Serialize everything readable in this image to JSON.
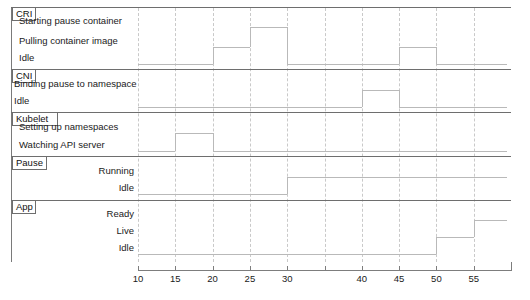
{
  "figure": {
    "kind": "timing-diagram",
    "title": "",
    "time_axis": {
      "label": "",
      "min": 10,
      "max": 59.5,
      "tick_step": 5,
      "ticks": [
        10,
        15,
        20,
        25,
        30,
        35,
        40,
        45,
        50,
        55
      ],
      "tick_labels": [
        "10",
        "15",
        "20",
        "25",
        "30",
        "35",
        "40",
        "45",
        "50",
        "55"
      ],
      "unlabeled_ticks": [
        35
      ],
      "grid": "dashed-vertical"
    },
    "colors": {
      "frame": "#6e6e6e",
      "grid": "#c9c9c9",
      "signal": "#b9b9b9",
      "axis": "#7d7d7d",
      "text": "#1a1a1a",
      "background": "#ffffff"
    }
  },
  "chart_data": {
    "type": "line",
    "title": "",
    "xlabel": "",
    "ylabel": "",
    "xlim": [
      10,
      59.5
    ],
    "grid": true,
    "legend": "none",
    "groups": [
      {
        "name": "CRI",
        "label_align": "left",
        "states": [
          "Starting pause container",
          "Pulling container image",
          "Idle"
        ],
        "transitions": [
          {
            "time": 10,
            "state": "Idle"
          },
          {
            "time": 20,
            "state": "Pulling container image"
          },
          {
            "time": 25,
            "state": "Starting pause container"
          },
          {
            "time": 30,
            "state": "Idle"
          },
          {
            "time": 45,
            "state": "Pulling container image"
          },
          {
            "time": 50,
            "state": "Idle"
          }
        ]
      },
      {
        "name": "CNI",
        "label_align": "left",
        "states": [
          "Binding pause to namespace",
          "Idle"
        ],
        "transitions": [
          {
            "time": 10,
            "state": "Idle"
          },
          {
            "time": 40,
            "state": "Binding pause to namespace"
          },
          {
            "time": 45,
            "state": "Idle"
          }
        ]
      },
      {
        "name": "Kubelet",
        "label_align": "left",
        "states": [
          "Setting up namespaces",
          "Watching API server"
        ],
        "transitions": [
          {
            "time": 10,
            "state": "Watching API server"
          },
          {
            "time": 15,
            "state": "Setting up namespaces"
          },
          {
            "time": 20,
            "state": "Watching API server"
          }
        ]
      },
      {
        "name": "Pause",
        "label_align": "right",
        "states": [
          "Running",
          "Idle"
        ],
        "transitions": [
          {
            "time": 10,
            "state": "Idle"
          },
          {
            "time": 30,
            "state": "Running"
          }
        ]
      },
      {
        "name": "App",
        "label_align": "right",
        "states": [
          "Ready",
          "Live",
          "Idle"
        ],
        "transitions": [
          {
            "time": 10,
            "state": "Idle"
          },
          {
            "time": 50,
            "state": "Live"
          },
          {
            "time": 55,
            "state": "Ready"
          }
        ]
      }
    ]
  }
}
